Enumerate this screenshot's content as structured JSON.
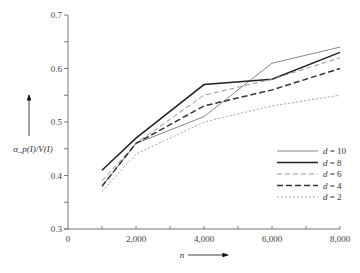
{
  "chart_data": {
    "type": "line",
    "title": "",
    "xlabel": "n",
    "ylabel": "α_p(I)/V(I)",
    "xlim": [
      0,
      8000
    ],
    "ylim": [
      0.3,
      0.7
    ],
    "x_ticks": [
      "0",
      "2,000",
      "4,000",
      "6,000",
      "8,000"
    ],
    "y_ticks": [
      "0.3",
      "0.4",
      "0.5",
      "0.6",
      "0.7"
    ],
    "grid": false,
    "legend_position": "lower right",
    "x": [
      1000,
      2000,
      4000,
      6000,
      8000
    ],
    "series": [
      {
        "name": "d = 10",
        "style": "thin-solid",
        "values": [
          0.38,
          0.46,
          0.51,
          0.61,
          0.64
        ]
      },
      {
        "name": "d = 8",
        "style": "thick-solid",
        "values": [
          0.41,
          0.47,
          0.57,
          0.58,
          0.63
        ]
      },
      {
        "name": "d = 6",
        "style": "thin-dashed",
        "values": [
          0.39,
          0.46,
          0.55,
          0.58,
          0.62
        ]
      },
      {
        "name": "d = 4",
        "style": "thick-dashed",
        "values": [
          0.38,
          0.46,
          0.53,
          0.56,
          0.6
        ]
      },
      {
        "name": "d = 2",
        "style": "dotted",
        "values": [
          0.37,
          0.44,
          0.5,
          0.53,
          0.55
        ]
      }
    ]
  }
}
